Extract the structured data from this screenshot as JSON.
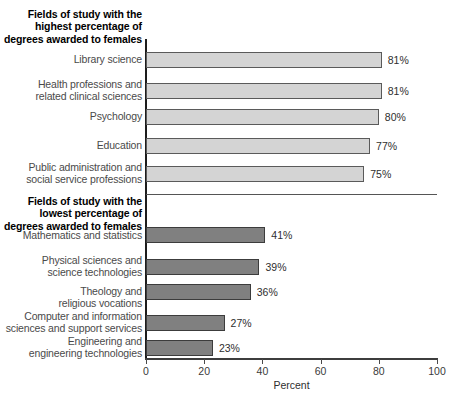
{
  "chart_data": {
    "type": "bar",
    "orientation": "horizontal",
    "title": "",
    "xlabel": "Percent",
    "ylabel": "",
    "xlim": [
      0,
      100
    ],
    "xticks": [
      0,
      20,
      40,
      60,
      80,
      100
    ],
    "grid": false,
    "legend": null,
    "groups": [
      {
        "id": "highest",
        "header": "Fields of study with the highest percentage of degrees awarded to females",
        "header_lines": [
          "Fields of study with the",
          "highest percentage of",
          "degrees awarded to females"
        ],
        "bar_color": "#d4d4d4",
        "categories": [
          "Library science",
          "Health professions and related clinical sciences",
          "Psychology",
          "Education",
          "Public administration and social service professions"
        ],
        "category_lines": [
          [
            "Library science"
          ],
          [
            "Health professions and",
            "related clinical sciences"
          ],
          [
            "Psychology"
          ],
          [
            "Education"
          ],
          [
            "Public administration and",
            "social service professions"
          ]
        ],
        "values": [
          81,
          81,
          80,
          77,
          75
        ],
        "value_labels": [
          "81%",
          "81%",
          "80%",
          "77%",
          "75%"
        ]
      },
      {
        "id": "lowest",
        "header": "Fields of study with the lowest percentage of degrees awarded to females",
        "header_lines": [
          "Fields of study with the",
          "lowest percentage of",
          "degrees awarded to females"
        ],
        "bar_color": "#808080",
        "categories": [
          "Mathematics and statistics",
          "Physical sciences and science technologies",
          "Theology and religious vocations",
          "Computer and information sciences and support services",
          "Engineering and engineering technologies"
        ],
        "category_lines": [
          [
            "Mathematics and statistics"
          ],
          [
            "Physical sciences and",
            "science technologies"
          ],
          [
            "Theology and",
            "religious vocations"
          ],
          [
            "Computer and information",
            "sciences and support services"
          ],
          [
            "Engineering and",
            "engineering technologies"
          ]
        ],
        "values": [
          41,
          39,
          36,
          27,
          23
        ],
        "value_labels": [
          "41%",
          "39%",
          "36%",
          "27%",
          "23%"
        ]
      }
    ]
  },
  "axis": {
    "xlabel": "Percent",
    "tick_labels": [
      "0",
      "20",
      "40",
      "60",
      "80",
      "100"
    ]
  },
  "groups": {
    "high": {
      "line1": "Fields of study with the",
      "line2": "highest percentage of",
      "line3": "degrees awarded to females"
    },
    "low": {
      "line1": "Fields of study with the",
      "line2": "lowest percentage of",
      "line3": "degrees awarded to females"
    }
  },
  "labels": {
    "h0a": "Library science",
    "h1a": "Health professions and",
    "h1b": "related clinical sciences",
    "h2a": "Psychology",
    "h3a": "Education",
    "h4a": "Public administration and",
    "h4b": "social service professions",
    "l0a": "Mathematics and statistics",
    "l1a": "Physical sciences and",
    "l1b": "science technologies",
    "l2a": "Theology and",
    "l2b": "religious vocations",
    "l3a": "Computer and information",
    "l3b": "sciences and support services",
    "l4a": "Engineering and",
    "l4b": "engineering technologies"
  },
  "values": {
    "h0": "81%",
    "h1": "81%",
    "h2": "80%",
    "h3": "77%",
    "h4": "75%",
    "l0": "41%",
    "l1": "39%",
    "l2": "36%",
    "l3": "27%",
    "l4": "23%"
  },
  "ticks": {
    "t0": "0",
    "t1": "20",
    "t2": "40",
    "t3": "60",
    "t4": "80",
    "t5": "100"
  },
  "colors": {
    "bar_light": "#d4d4d4",
    "bar_dark": "#808080",
    "axis": "#3d3d3d",
    "text": "#3a3a3a"
  }
}
